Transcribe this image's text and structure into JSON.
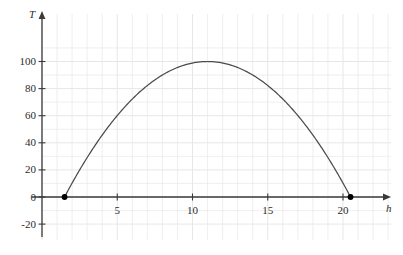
{
  "chart_data": {
    "type": "line",
    "title": "",
    "xlabel": "h",
    "ylabel": "T",
    "xlim": [
      0,
      22.2
    ],
    "ylim": [
      -24,
      108
    ],
    "grid": true,
    "grid_color": "#e9e6e8",
    "curve_color": "#4a4a4a",
    "marker_color": "#000000",
    "axis_color": "#3a3a3a",
    "legend": "none",
    "xticks": [
      5,
      10,
      15,
      20
    ],
    "xtick_labels": [
      "5",
      "10",
      "15",
      "20"
    ],
    "yticks": [
      -20,
      0,
      20,
      40,
      60,
      80,
      100
    ],
    "ytick_labels": [
      "-20",
      "0",
      "20",
      "40",
      "60",
      "80",
      "100"
    ],
    "equation": "T = 100 - (100/90.25)*(h - 11)^2",
    "vertex": {
      "h": 11,
      "T": 100
    },
    "roots": [
      1.5,
      20.5
    ],
    "endpoint_markers": [
      {
        "h": 1.5,
        "T": 0
      },
      {
        "h": 20.5,
        "T": 0
      }
    ],
    "series": [
      {
        "name": "T(h)",
        "points": [
          {
            "h": 1.5,
            "T": 0
          },
          {
            "h": 2.0,
            "T": 10.3
          },
          {
            "h": 2.5,
            "T": 20.1
          },
          {
            "h": 3.0,
            "T": 29.4
          },
          {
            "h": 3.5,
            "T": 38.2
          },
          {
            "h": 4.0,
            "T": 46.5
          },
          {
            "h": 4.5,
            "T": 54.3
          },
          {
            "h": 5.0,
            "T": 61.6
          },
          {
            "h": 5.5,
            "T": 68.4
          },
          {
            "h": 6.0,
            "T": 74.7
          },
          {
            "h": 6.5,
            "T": 80.5
          },
          {
            "h": 7.0,
            "T": 85.9
          },
          {
            "h": 7.5,
            "T": 90.7
          },
          {
            "h": 8.0,
            "T": 95.0
          },
          {
            "h": 8.5,
            "T": 98.9
          },
          {
            "h": 9.0,
            "T": 95.6
          },
          {
            "h": 9.5,
            "T": 97.5
          },
          {
            "h": 10.0,
            "T": 98.9
          },
          {
            "h": 10.5,
            "T": 99.7
          },
          {
            "h": 11.0,
            "T": 100.0
          },
          {
            "h": 11.5,
            "T": 99.7
          },
          {
            "h": 12.0,
            "T": 98.9
          },
          {
            "h": 12.5,
            "T": 97.5
          },
          {
            "h": 13.0,
            "T": 95.6
          },
          {
            "h": 13.5,
            "T": 93.1
          },
          {
            "h": 14.0,
            "T": 90.0
          },
          {
            "h": 14.5,
            "T": 86.4
          },
          {
            "h": 15.0,
            "T": 82.3
          },
          {
            "h": 15.5,
            "T": 77.6
          },
          {
            "h": 16.0,
            "T": 72.3
          },
          {
            "h": 16.5,
            "T": 66.5
          },
          {
            "h": 17.0,
            "T": 60.1
          },
          {
            "h": 17.5,
            "T": 53.2
          },
          {
            "h": 18.0,
            "T": 45.7
          },
          {
            "h": 18.5,
            "T": 37.7
          },
          {
            "h": 19.0,
            "T": 29.1
          },
          {
            "h": 19.5,
            "T": 20.0
          },
          {
            "h": 20.0,
            "T": 10.3
          },
          {
            "h": 20.5,
            "T": 0
          }
        ]
      }
    ]
  }
}
